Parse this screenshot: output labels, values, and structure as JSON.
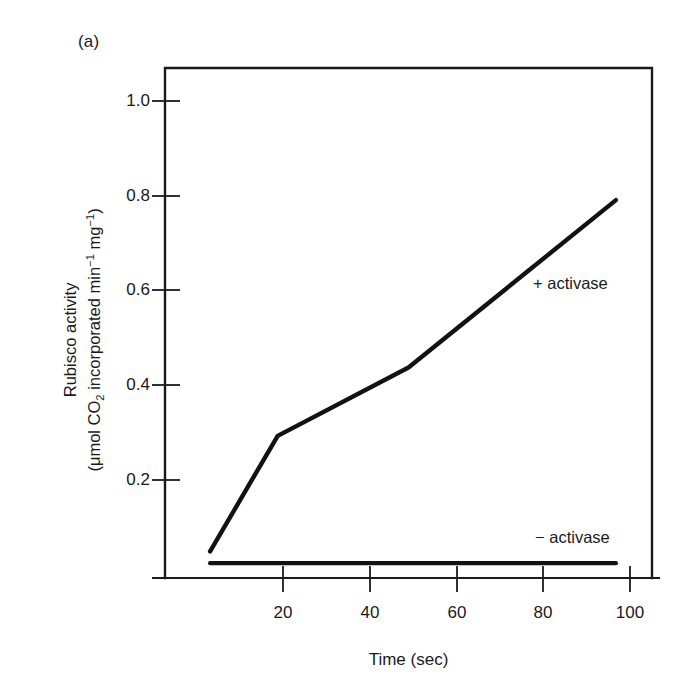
{
  "figure": {
    "panel_label": "(a)",
    "background_color": "#ffffff",
    "ink_color": "#1a1a1a"
  },
  "axes": {
    "x": {
      "title": "Time (sec)",
      "ticks": [
        20,
        40,
        60,
        80,
        100
      ],
      "tick_labels": [
        "20",
        "40",
        "60",
        "80",
        "100"
      ],
      "range": [
        0,
        108
      ]
    },
    "y": {
      "title_line1": "Rubisco activity",
      "title_line2_prefix": "(",
      "title_line2_mu": "μmol CO",
      "title_line2_sub": "2",
      "title_line2_mid": " incorporated min",
      "title_line2_sup1": "−1",
      "title_line2_mid2": " mg",
      "title_line2_sup2": "−1",
      "title_line2_suffix": ")",
      "ticks": [
        0.2,
        0.4,
        0.6,
        0.8,
        1.0
      ],
      "tick_labels": [
        "0.2",
        "0.4",
        "0.6",
        "0.8",
        "1.0"
      ],
      "range": [
        0,
        1.075
      ]
    }
  },
  "annotations": {
    "plus_activase": "+ activase",
    "minus_activase": "− activase"
  },
  "chart_data": {
    "type": "line",
    "title": "",
    "subtitle": "",
    "xlabel": "Time (sec)",
    "ylabel": "Rubisco activity (μmol CO2 incorporated min-1 mg-1)",
    "xlim": [
      0,
      108
    ],
    "ylim": [
      0,
      1.075
    ],
    "grid": false,
    "legend": "in-plot annotations",
    "xticks": [
      20,
      40,
      60,
      80,
      100
    ],
    "yticks": [
      0.2,
      0.4,
      0.6,
      0.8,
      1.0
    ],
    "series": [
      {
        "name": "+ activase",
        "label_position": "right-of-line, mid-upper plot",
        "x": [
          10,
          25,
          54,
          100
        ],
        "y": [
          0.05,
          0.295,
          0.44,
          0.795
        ]
      },
      {
        "name": "− activase",
        "label_position": "right-of-line, lower plot",
        "x": [
          10,
          100
        ],
        "y": [
          0.025,
          0.025
        ]
      }
    ]
  }
}
